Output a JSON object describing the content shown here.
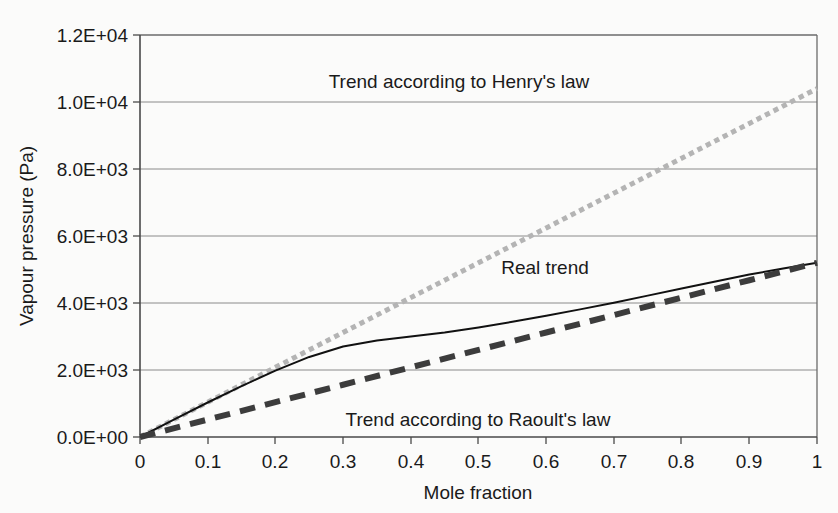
{
  "chart_data": {
    "type": "line",
    "title": "",
    "xlabel": "Mole fraction",
    "ylabel": "Vapour pressure (Pa)",
    "xlim": [
      0,
      1
    ],
    "ylim": [
      0,
      12000
    ],
    "grid": "horizontal",
    "legend_position": "none",
    "x_ticks": [
      "0",
      "0.1",
      "0.2",
      "0.3",
      "0.4",
      "0.5",
      "0.6",
      "0.7",
      "0.8",
      "0.9",
      "1"
    ],
    "x_tick_values": [
      0,
      0.1,
      0.2,
      0.3,
      0.4,
      0.5,
      0.6,
      0.7,
      0.8,
      0.9,
      1
    ],
    "y_ticks": [
      "0.0E+00",
      "2.0E+03",
      "4.0E+03",
      "6.0E+03",
      "8.0E+03",
      "1.0E+04",
      "1.2E+04"
    ],
    "y_tick_values": [
      0,
      2000,
      4000,
      6000,
      8000,
      10000,
      12000
    ],
    "series": [
      {
        "name": "Trend according to Henry's law",
        "style": "dotted",
        "color": "#b4b4b4",
        "width": 5,
        "x": [
          0,
          0.1,
          0.2,
          0.3,
          0.4,
          0.5,
          0.6,
          0.7,
          0.8,
          0.9,
          1
        ],
        "values": [
          0,
          1040,
          2080,
          3120,
          4160,
          5200,
          6240,
          7280,
          8320,
          9360,
          10400
        ]
      },
      {
        "name": "Real trend",
        "style": "solid",
        "color": "#111111",
        "width": 2,
        "x": [
          0,
          0.05,
          0.1,
          0.15,
          0.2,
          0.25,
          0.3,
          0.35,
          0.4,
          0.45,
          0.5,
          0.55,
          0.6,
          0.65,
          0.7,
          0.75,
          0.8,
          0.85,
          0.9,
          0.95,
          1
        ],
        "values": [
          0,
          520,
          1030,
          1520,
          1980,
          2390,
          2700,
          2880,
          3000,
          3120,
          3270,
          3440,
          3620,
          3810,
          4010,
          4220,
          4430,
          4640,
          4850,
          5030,
          5200
        ]
      },
      {
        "name": "Trend according to Raoult's law",
        "style": "dashed",
        "color": "#3c3c3c",
        "width": 6,
        "x": [
          0,
          0.1,
          0.2,
          0.3,
          0.4,
          0.5,
          0.6,
          0.7,
          0.8,
          0.9,
          1
        ],
        "values": [
          0,
          520,
          1040,
          1560,
          2080,
          2600,
          3120,
          3640,
          4160,
          4680,
          5200
        ]
      }
    ],
    "annotations": [
      {
        "text": "Trend according to Henry's law",
        "x": 0.47,
        "y": 10760
      },
      {
        "text": "Real trend",
        "x": 0.55,
        "y": 4900
      },
      {
        "text": "Trend according to Raoult's law",
        "x": 0.35,
        "y": 1180
      }
    ],
    "colors": {
      "background": "#fbfbfa",
      "plot_border": "#6b6b6b",
      "gridline": "#8a8a8a",
      "henry_line": "#b4b4b4",
      "real_line": "#111111",
      "raoult_line": "#3c3c3c",
      "text": "#1a1a1a"
    }
  }
}
